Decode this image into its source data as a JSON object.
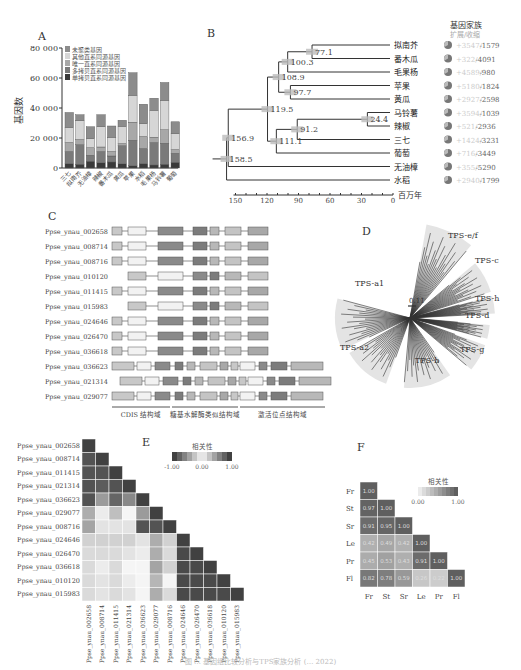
{
  "panels": {
    "A": "A",
    "B": "B",
    "C": "C",
    "D": "D",
    "E": "E",
    "F": "F"
  },
  "chart_data": [
    {
      "id": "A",
      "type": "bar",
      "stacked": true,
      "title": "",
      "ylabel": "基因数",
      "ylim": [
        0,
        80000
      ],
      "yticks": [
        "0",
        "20 000",
        "40 000",
        "60 000",
        "80 000"
      ],
      "categories": [
        "三七",
        "拟南芥",
        "无油樟",
        "辣椒",
        "番木瓜",
        "黄瓜",
        "苹果",
        "水稻",
        "毛果杨",
        "马铃薯",
        "葡萄"
      ],
      "legend": [
        "未聚类基因",
        "其他直系同源基因",
        "唯一直系同源基因",
        "多拷贝直系同源基因",
        "单拷贝直系同源基因"
      ],
      "series": [
        {
          "name": "单拷贝直系同源基因",
          "color": "#3a3a3a",
          "values": [
            3000,
            2500,
            4500,
            3500,
            4000,
            2800,
            1500,
            3000,
            2000,
            2500,
            3800
          ]
        },
        {
          "name": "多拷贝直系同源基因",
          "color": "#7a7a7a",
          "values": [
            8000,
            13000,
            4000,
            7500,
            4000,
            12000,
            17000,
            10000,
            15000,
            14000,
            6000
          ]
        },
        {
          "name": "唯一直系同源基因",
          "color": "#a8a8a8",
          "values": [
            6000,
            3500,
            5000,
            3000,
            3000,
            1500,
            12000,
            8000,
            3500,
            9000,
            2500
          ]
        },
        {
          "name": "其他直系同源基因",
          "color": "#d6d6d6",
          "values": [
            10000,
            12500,
            6000,
            13500,
            9500,
            11500,
            18000,
            8500,
            18000,
            19500,
            10500
          ]
        },
        {
          "name": "未聚类基因",
          "color": "#8c8c8c",
          "values": [
            10000,
            4000,
            8000,
            8000,
            7500,
            4000,
            15000,
            13000,
            8000,
            12000,
            8000
          ]
        }
      ]
    },
    {
      "id": "B",
      "type": "tree",
      "title": "",
      "axis_label": "百万年",
      "axis_ticks": [
        "150",
        "120",
        "90",
        "60",
        "30",
        "0"
      ],
      "node_ages": [
        "77.1",
        "100.3",
        "108.9",
        "97.7",
        "119.5",
        "156.9",
        "24.4",
        "91.2",
        "111.1",
        "158.5"
      ],
      "family_header": "基因家族",
      "family_subheader": "扩展/收缩",
      "taxa": [
        {
          "name": "拟南芥",
          "expand": "+3547",
          "contract": "-1579"
        },
        {
          "name": "番木瓜",
          "expand": "+322",
          "contract": "-4091"
        },
        {
          "name": "毛果杨",
          "expand": "+4589",
          "contract": "-980"
        },
        {
          "name": "苹果",
          "expand": "+5180",
          "contract": "-1824"
        },
        {
          "name": "黄瓜",
          "expand": "+2927",
          "contract": "-2598"
        },
        {
          "name": "马铃薯",
          "expand": "+3594",
          "contract": "-1039"
        },
        {
          "name": "辣椒",
          "expand": "+521",
          "contract": "-2936"
        },
        {
          "name": "三七",
          "expand": "+1424",
          "contract": "-3231"
        },
        {
          "name": "葡萄",
          "expand": "+716",
          "contract": "-3449"
        },
        {
          "name": "无油樟",
          "expand": "+355",
          "contract": "-5290"
        },
        {
          "name": "水稻",
          "expand": "+2940",
          "contract": "-1799"
        }
      ]
    },
    {
      "id": "C",
      "type": "gene-structure",
      "genes": [
        "Ppse_ynau_002658",
        "Ppse_ynau_008714",
        "Ppse_ynau_008716",
        "Ppse_ynau_010120",
        "Ppse_ynau_011415",
        "Ppse_ynau_015983",
        "Ppse_ynau_024646",
        "Ppse_ynau_026470",
        "Ppse_ynau_036618",
        "Ppse_ynau_036623",
        "Ppse_ynau_021314",
        "Ppse_ynau_029077"
      ],
      "domains": [
        "CDIS 结构域",
        "糖基水解酶类似结构域",
        "激活位点结构域"
      ]
    },
    {
      "id": "D",
      "type": "phylogeny",
      "scale": "0.11",
      "clades": [
        "TPS-e/f",
        "TPS-c",
        "TPS-h",
        "TPS-d",
        "TPS-g",
        "TPS-b",
        "TPS-a2",
        "TPS-a1"
      ]
    },
    {
      "id": "E",
      "type": "heatmap",
      "legend_title": "相关性",
      "legend_ticks": [
        "-1.00",
        "0.00",
        "1.00"
      ],
      "labels": [
        "Ppse_ynau_002658",
        "Ppse_ynau_008714",
        "Ppse_ynau_011415",
        "Ppse_ynau_021314",
        "Ppse_ynau_036623",
        "Ppse_ynau_029077",
        "Ppse_ynau_008716",
        "Ppse_ynau_024646",
        "Ppse_ynau_026470",
        "Ppse_ynau_036618",
        "Ppse_ynau_010120",
        "Ppse_ynau_015983"
      ],
      "values": [
        [
          1.0
        ],
        [
          0.9,
          1.0
        ],
        [
          0.9,
          0.9,
          1.0
        ],
        [
          0.9,
          0.85,
          0.9,
          1.0
        ],
        [
          0.9,
          0.5,
          0.8,
          0.6,
          1.0
        ],
        [
          0.4,
          0.05,
          0.3,
          0.0,
          0.5,
          1.0
        ],
        [
          0.45,
          0.1,
          0.1,
          0.1,
          0.9,
          0.9,
          1.0
        ],
        [
          0.2,
          0.2,
          0.2,
          0.2,
          0.1,
          0.4,
          0.2,
          1.0
        ],
        [
          0.15,
          0.15,
          0.15,
          0.1,
          0.05,
          0.4,
          0.15,
          0.95,
          1.0
        ],
        [
          0.15,
          0.05,
          0.15,
          0.0,
          0.0,
          0.45,
          0.2,
          0.95,
          0.95,
          1.0
        ],
        [
          0.15,
          0.1,
          0.15,
          0.05,
          0.0,
          0.35,
          0.0,
          0.95,
          0.95,
          0.95,
          1.0
        ],
        [
          0.15,
          0.1,
          0.15,
          0.1,
          0.0,
          0.4,
          0.15,
          0.95,
          0.95,
          0.95,
          0.95,
          1.0
        ]
      ]
    },
    {
      "id": "F",
      "type": "heatmap",
      "legend_title": "相关性",
      "legend_ticks": [
        "0.00",
        "1.00"
      ],
      "labels": [
        "Fr",
        "St",
        "Sr",
        "Le",
        "Pr",
        "Fl"
      ],
      "values": [
        [
          "1.00"
        ],
        [
          "0.97",
          "1.00"
        ],
        [
          "0.91",
          "0.95",
          "1.00"
        ],
        [
          "0.42",
          "0.49",
          "0.42",
          "1.00"
        ],
        [
          "0.45",
          "0.53",
          "0.43",
          "0.91",
          "1.00"
        ],
        [
          "0.82",
          "0.78",
          "0.59",
          "0.26",
          "0.22",
          "1.00"
        ]
      ]
    }
  ],
  "caption": "图 … 基因组比较分析与TPS家族分析 (… 2022)"
}
